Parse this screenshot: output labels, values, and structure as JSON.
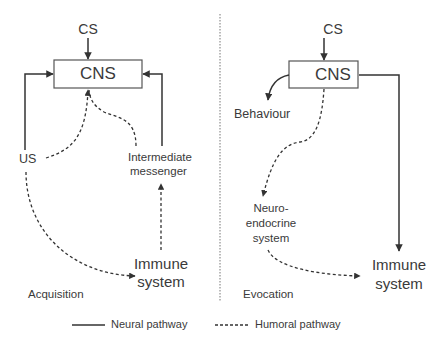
{
  "diagram": {
    "left_panel": {
      "phase_label": "Acquisition",
      "nodes": {
        "cs": "CS",
        "cns": "CNS",
        "us": "US",
        "intermediate_messenger_line1": "Intermediate",
        "intermediate_messenger_line2": "messenger",
        "immune_line1": "Immune",
        "immune_line2": "system"
      },
      "edges": [
        {
          "from": "CS",
          "to": "CNS",
          "type": "neural"
        },
        {
          "from": "US",
          "to": "CNS",
          "type": "neural"
        },
        {
          "from": "US",
          "to": "CNS",
          "type": "humoral"
        },
        {
          "from": "US",
          "to": "Immune system",
          "type": "humoral"
        },
        {
          "from": "Immune system",
          "to": "Intermediate messenger",
          "type": "humoral"
        },
        {
          "from": "Intermediate messenger",
          "to": "CNS",
          "type": "humoral"
        },
        {
          "from": "Intermediate messenger",
          "to": "CNS",
          "type": "neural"
        }
      ]
    },
    "right_panel": {
      "phase_label": "Evocation",
      "nodes": {
        "cs": "CS",
        "cns": "CNS",
        "behaviour": "Behaviour",
        "neuro_line1": "Neuro-",
        "neuro_line2": "endocrine",
        "neuro_line3": "system",
        "immune_line1": "Immune",
        "immune_line2": "system"
      },
      "edges": [
        {
          "from": "CS",
          "to": "CNS",
          "type": "neural"
        },
        {
          "from": "CNS",
          "to": "Behaviour",
          "type": "neural"
        },
        {
          "from": "CNS",
          "to": "Neuro-endocrine system",
          "type": "humoral"
        },
        {
          "from": "CNS",
          "to": "Immune system",
          "type": "neural"
        },
        {
          "from": "Neuro-endocrine system",
          "to": "Immune system",
          "type": "humoral"
        }
      ]
    },
    "legend": {
      "neural": "Neural pathway",
      "humoral": "Humoral pathway"
    },
    "colors": {
      "line": "#333333",
      "text": "#3a3a3a",
      "divider": "#777777"
    }
  }
}
